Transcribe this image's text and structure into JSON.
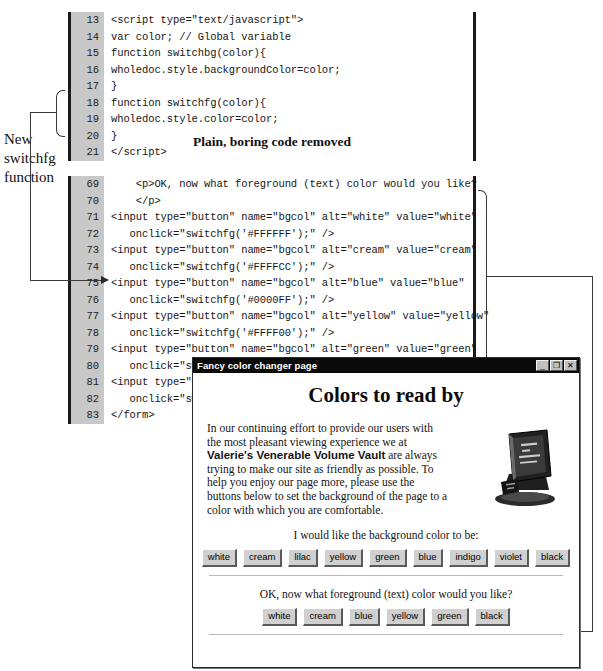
{
  "figure": {
    "caption_between_listings": "Plain, boring code removed",
    "left_annotation": "New switchfg function"
  },
  "code_block_1": {
    "lines": [
      {
        "num": "13",
        "text": "<script type=\"text/javascript\">"
      },
      {
        "num": "14",
        "text": "var color; // Global variable"
      },
      {
        "num": "15",
        "text": "function switchbg(color){"
      },
      {
        "num": "16",
        "text": "wholedoc.style.backgroundColor=color;"
      },
      {
        "num": "17",
        "text": "}"
      },
      {
        "num": "18",
        "text": "function switchfg(color){"
      },
      {
        "num": "19",
        "text": "wholedoc.style.color=color;"
      },
      {
        "num": "20",
        "text": "}"
      },
      {
        "num": "21",
        "text": "</scr"
      }
    ],
    "line_21_tail": "ipt>"
  },
  "code_block_2": {
    "lines": [
      {
        "num": "69",
        "text": "    <p>OK, now what foreground (text) color would you like?"
      },
      {
        "num": "70",
        "text": "    </p>"
      },
      {
        "num": "71",
        "text": "<input type=\"button\" name=\"bgcol\" alt=\"white\" value=\"white\""
      },
      {
        "num": "72",
        "text": "   onclick=\"switchfg('#FFFFFF');\" />"
      },
      {
        "num": "73",
        "text": "<input type=\"button\" name=\"bgcol\" alt=\"cream\" value=\"cream\""
      },
      {
        "num": "74",
        "text": "   onclick=\"switchfg('#FFFFCC');\" />"
      },
      {
        "num": "75",
        "text": "<input type=\"button\" name=\"bgcol\" alt=\"blue\" value=\"blue\""
      },
      {
        "num": "76",
        "text": "   onclick=\"switchfg('#0000FF');\" />"
      },
      {
        "num": "77",
        "text": "<input type=\"button\" name=\"bgcol\" alt=\"yellow\" value=\"yellow\""
      },
      {
        "num": "78",
        "text": "   onclick=\"switchfg('#FFFF00');\" />"
      },
      {
        "num": "79",
        "text": "<input type=\"button\" name=\"bgcol\" alt=\"green\" value=\"green\""
      },
      {
        "num": "80",
        "text": "   onclick=\"switchfg('#336600');\" />"
      },
      {
        "num": "81",
        "text": "<input type=\"button\" name=\"bgcol\" alt=\"black\" value=\"black\""
      },
      {
        "num": "82",
        "text": "   onclick=\"switchfg('#000000');\" />"
      },
      {
        "num": "83",
        "text": "</form>"
      }
    ]
  },
  "browser": {
    "title": "Fancy color changer page",
    "window_controls": {
      "minimize": "_",
      "maximize": "❐",
      "close": "✕"
    },
    "heading": "Colors to read by",
    "intro_part1": "In our continuing effort to provide our users with the most pleasant viewing experience we at ",
    "intro_bold": "Valerie's Venerable Volume Vault",
    "intro_part2": " are always trying to make our site as friendly as possible. To help you enjoy our page more, please use the buttons below to set the background of the page to a color with which you are comfortable.",
    "book_alt": "book-illustration",
    "background_prompt": "I would like the background color to be:",
    "background_buttons": [
      "white",
      "cream",
      "lilac",
      "yellow",
      "green",
      "blue",
      "indigo",
      "violet",
      "black"
    ],
    "foreground_prompt": "OK, now what foreground (text) color would you like?",
    "foreground_buttons": [
      "white",
      "cream",
      "blue",
      "yellow",
      "green",
      "black"
    ]
  },
  "colors": {
    "gutter_bg": "#c8c8c8",
    "listing_border": "#1a1a1a",
    "titlebar_bg": "#0a0a0a",
    "button_face": "#d0d0d0",
    "callout": "#3a3a3a"
  }
}
